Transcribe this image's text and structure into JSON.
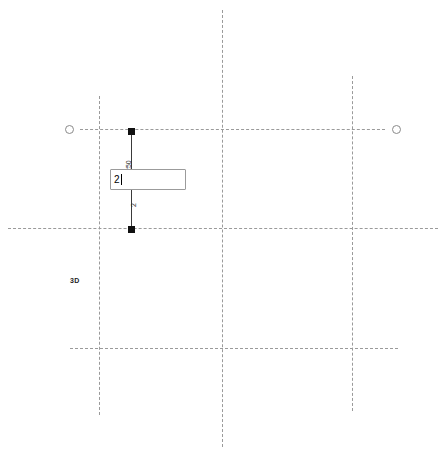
{
  "canvas": {
    "width": 446,
    "height": 457,
    "background": "#ffffff",
    "line_color": "#9a9a9a",
    "element_color": "#3a3a3a",
    "grip_color": "#111111"
  },
  "view": {
    "label": "3D"
  },
  "grid_lines": {
    "vertical": [
      {
        "name": "grid-line-vertical-1",
        "x": 99,
        "y": 96,
        "length": 319
      },
      {
        "name": "grid-line-vertical-2",
        "x": 222,
        "y": 10,
        "length": 437
      },
      {
        "name": "grid-line-vertical-3",
        "x": 352,
        "y": 76,
        "length": 335
      }
    ],
    "horizontal": [
      {
        "name": "grid-line-horizontal-1",
        "y": 129,
        "x": 80,
        "length": 305
      },
      {
        "name": "grid-line-horizontal-2",
        "y": 228,
        "x": 8,
        "length": 430
      },
      {
        "name": "grid-line-horizontal-3",
        "y": 348,
        "x": 70,
        "length": 328
      }
    ]
  },
  "grid_bubbles": [
    {
      "name": "grid-bubble-left",
      "x": 65,
      "y": 125
    },
    {
      "name": "grid-bubble-right",
      "x": 392,
      "y": 125
    }
  ],
  "selected_element": {
    "name": "wall-element",
    "line": {
      "x": 131,
      "y_top": 131,
      "y_bottom": 229
    },
    "grips": [
      {
        "name": "grip-top",
        "x": 128,
        "y": 128
      },
      {
        "name": "grip-bottom",
        "x": 128,
        "y": 226
      }
    ]
  },
  "dimension": {
    "upper_value": "250",
    "upper_x": 125,
    "upper_y": 172,
    "lower_value": "2",
    "lower_x": 130,
    "lower_y": 207
  },
  "edit_box": {
    "name": "dimension-edit-input",
    "value": "2",
    "placeholder": "",
    "x": 110,
    "y": 169,
    "width": 76,
    "height": 21
  }
}
